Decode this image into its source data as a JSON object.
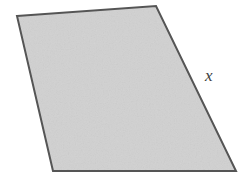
{
  "figure": {
    "name": "quadrilateral-with-labeled-side",
    "background_color": "#ffffff",
    "shape": {
      "name": "quadrilateral",
      "fill_color": "#cccccc",
      "stroke_color": "#555555",
      "stroke_width": 2,
      "texture": "fine-grain-noise",
      "vertices": [
        {
          "name": "top-left",
          "x": 17,
          "y": 16
        },
        {
          "name": "top-right",
          "x": 156,
          "y": 6
        },
        {
          "name": "bottom-right",
          "x": 236,
          "y": 171
        },
        {
          "name": "bottom-left",
          "x": 53,
          "y": 171
        }
      ],
      "points_attr": "17,16 156,6 236,171 53,171"
    },
    "labels": [
      {
        "id": "x",
        "text": "x",
        "style": "italic",
        "color": "#3d3d3d",
        "labels_side": "right",
        "x": 211,
        "y": 75
      }
    ]
  }
}
